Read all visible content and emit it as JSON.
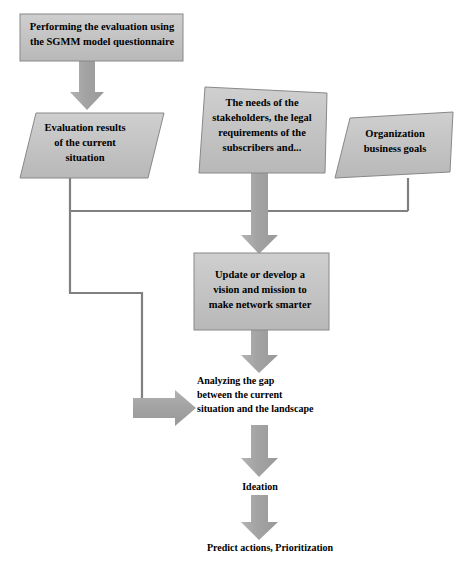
{
  "diagram": {
    "colors": {
      "node_fill": "#bfbfbf",
      "node_fill_light": "#c8c8c8",
      "node_stroke": "#808080",
      "arrow_fill": "#a6a6a6",
      "connector_stroke": "#808080",
      "text": "#000000",
      "background": "#ffffff"
    },
    "nodes": [
      {
        "id": "performing-evaluation",
        "shape": "rectangle",
        "label": "Performing the evaluation using\nthe SGMM model questionnaire"
      },
      {
        "id": "evaluation-results",
        "shape": "parallelogram",
        "label": "Evaluation results\nof the current\nsituation"
      },
      {
        "id": "stakeholder-needs",
        "shape": "parallelogram",
        "label": "The needs of the\nstakeholders, the legal\nrequirements of the\nsubscribers and..."
      },
      {
        "id": "organization-goals",
        "shape": "parallelogram",
        "label": "Organization\nbusiness goals"
      },
      {
        "id": "vision-mission",
        "shape": "rectangle",
        "label": "Update or develop a\nvision and mission to\nmake network smarter"
      },
      {
        "id": "analyzing-gap",
        "shape": "text",
        "label": "Analyzing the gap\nbetween the current\nsituation and the landscape"
      },
      {
        "id": "ideation",
        "shape": "text",
        "label": "Ideation"
      },
      {
        "id": "predict-actions",
        "shape": "text",
        "label": "Predict actions, Prioritization"
      }
    ],
    "connectors": [
      {
        "id": "arrow-eval-down",
        "type": "block-arrow",
        "direction": "down",
        "from": "performing-evaluation",
        "to": "evaluation-results"
      },
      {
        "id": "arrow-needs-down",
        "type": "block-arrow",
        "direction": "down",
        "from": "stakeholder-needs",
        "to": "vision-mission"
      },
      {
        "id": "line-eval-bus",
        "type": "elbow-line",
        "from": "evaluation-results",
        "to": "analyzing-gap"
      },
      {
        "id": "line-org-bus",
        "type": "elbow-line",
        "from": "organization-goals",
        "to": "vision-mission"
      },
      {
        "id": "arrow-gap-right",
        "type": "block-arrow",
        "direction": "right",
        "from": "evaluation-results",
        "to": "analyzing-gap"
      },
      {
        "id": "arrow-vision-gap",
        "type": "block-arrow",
        "direction": "down",
        "from": "vision-mission",
        "to": "analyzing-gap"
      },
      {
        "id": "arrow-gap-ideation",
        "type": "block-arrow",
        "direction": "down",
        "from": "analyzing-gap",
        "to": "ideation"
      },
      {
        "id": "arrow-ideation-predict",
        "type": "block-arrow",
        "direction": "down",
        "from": "ideation",
        "to": "predict-actions"
      }
    ]
  }
}
